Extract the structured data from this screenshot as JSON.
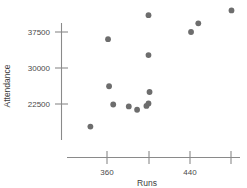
{
  "chart_data": {
    "type": "scatter",
    "title": "",
    "xlabel": "Runs",
    "ylabel": "Attendance",
    "xlim": [
      340,
      500
    ],
    "ylim": [
      15000,
      43000
    ],
    "grid": false,
    "legend": null,
    "xticks": [
      360,
      400,
      440,
      480
    ],
    "xtick_labels": [
      "360",
      "",
      "440",
      ""
    ],
    "yticks": [
      22500,
      30000,
      37500
    ],
    "ytick_labels": [
      "22500",
      "30000",
      "37500"
    ],
    "point_color": "#6d6d6d",
    "axis_color": "#8a8a8a",
    "points": [
      {
        "x": 344,
        "y": 17800
      },
      {
        "x": 361,
        "y": 36000
      },
      {
        "x": 362,
        "y": 26200
      },
      {
        "x": 366,
        "y": 22400
      },
      {
        "x": 381,
        "y": 22000
      },
      {
        "x": 389,
        "y": 21300
      },
      {
        "x": 400,
        "y": 41000
      },
      {
        "x": 400,
        "y": 32700
      },
      {
        "x": 401,
        "y": 25000
      },
      {
        "x": 398,
        "y": 22100
      },
      {
        "x": 400,
        "y": 22600
      },
      {
        "x": 441,
        "y": 37500
      },
      {
        "x": 448,
        "y": 39300
      },
      {
        "x": 480,
        "y": 42000
      }
    ]
  },
  "axis": {
    "x_title": "Runs",
    "y_title": "Attendance",
    "x_tick_0": "360",
    "x_tick_1": "440",
    "y_tick_0": "22500",
    "y_tick_1": "30000",
    "y_tick_2": "37500"
  }
}
